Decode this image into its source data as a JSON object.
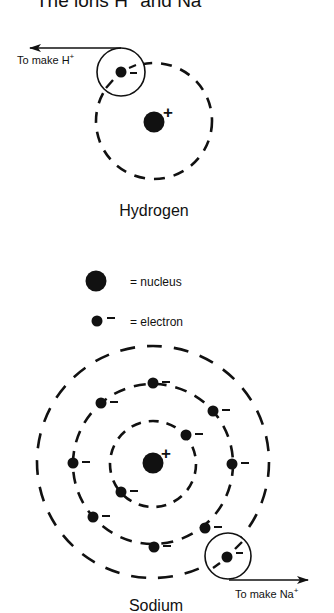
{
  "header": {
    "title": "The ions H",
    "title_sup1": "+",
    "title_mid": " and Na",
    "title_sup2": "+"
  },
  "colors": {
    "ink": "#111111",
    "background": "#ffffff"
  },
  "hydrogen": {
    "label": "Hydrogen",
    "nucleus_sign": "+",
    "electron_sign": "=",
    "arrow_label": "To make H",
    "arrow_label_sup": "+",
    "shells": 1,
    "electrons_per_shell": [
      1
    ],
    "arrow_direction": "left"
  },
  "legend": {
    "nucleus_label": "= nucleus",
    "electron_sign": "–",
    "electron_label": "= electron"
  },
  "sodium": {
    "label": "Sodium",
    "nucleus_sign": "+",
    "electron_sign": "–",
    "arrow_label": "To make Na",
    "arrow_label_sup": "+",
    "shells": 3,
    "electrons_per_shell": [
      2,
      8,
      1
    ],
    "arrow_direction": "right"
  }
}
